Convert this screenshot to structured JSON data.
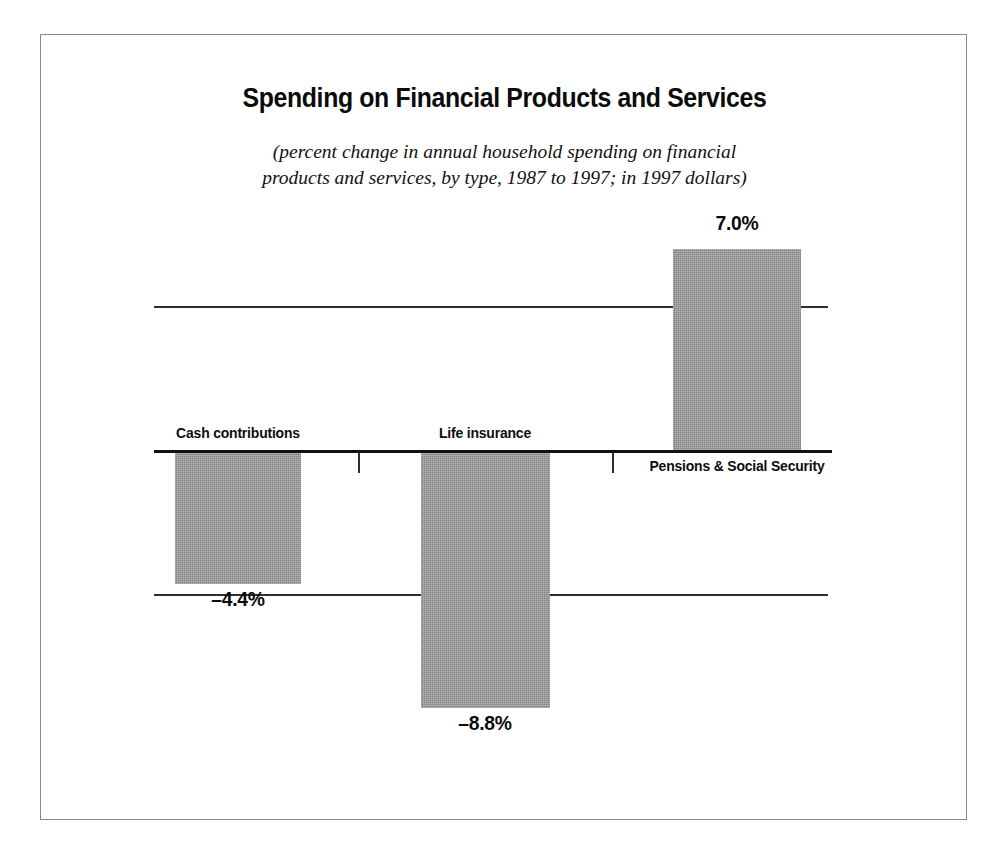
{
  "chart_data": {
    "type": "bar",
    "title": "Spending on Financial Products and Services",
    "subtitle_line1": "(percent change in annual household spending on financial",
    "subtitle_line2": "products and services, by type, 1987 to 1997; in 1997 dollars)",
    "categories": [
      "Cash contributions",
      "Life insurance",
      "Pensions & Social Security"
    ],
    "values": [
      -4.4,
      -8.8,
      7.0
    ],
    "value_labels": [
      "–4.4%",
      "–8.8%",
      "7.0%"
    ],
    "xlabel": "",
    "ylabel": "",
    "ylim": [
      -10,
      8.5
    ],
    "gridlines": [
      5,
      -5
    ],
    "zero_axis": 0,
    "grid": true,
    "legend": "none",
    "bar_color": "#979797",
    "axis_color": "#111111",
    "text_color": "#0b0b0b"
  }
}
